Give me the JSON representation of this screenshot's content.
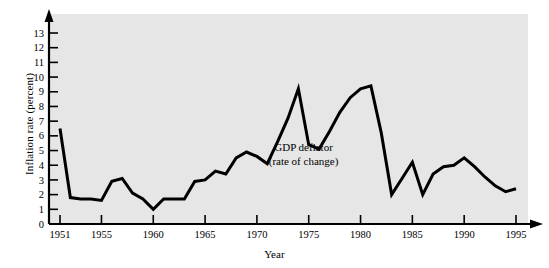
{
  "chart_data": {
    "type": "line",
    "title": "",
    "subtitle": "",
    "xlabel": "Year",
    "ylabel": "Inflation rate (percent)",
    "xlim": [
      1951,
      1995
    ],
    "ylim": [
      0,
      13
    ],
    "grid": false,
    "legend_position": "none",
    "annotations": [
      {
        "name": "series-annotation",
        "line1": "GDP deflator",
        "line2": "(rate of change)",
        "x": 1974.5,
        "y": 5.1
      }
    ],
    "x_ticks_labeled": [
      1951,
      1955,
      1960,
      1965,
      1970,
      1975,
      1980,
      1985,
      1990,
      1995
    ],
    "x_tick_labels": [
      "1951",
      "1955",
      "1960",
      "1965",
      "1970",
      "1975",
      "1980",
      "1985",
      "1990",
      "1995"
    ],
    "y_ticks": [
      0,
      1,
      2,
      3,
      4,
      5,
      6,
      7,
      8,
      9,
      10,
      11,
      12,
      13
    ],
    "y_tick_labels": [
      "0",
      "1",
      "2",
      "3",
      "4",
      "5",
      "6",
      "7",
      "8",
      "9",
      "10",
      "11",
      "12",
      "13"
    ],
    "series": [
      {
        "name": "GDP deflator (rate of change)",
        "color": "#000000",
        "line_width": 3,
        "x": [
          1951,
          1952,
          1953,
          1954,
          1955,
          1956,
          1957,
          1958,
          1959,
          1960,
          1961,
          1962,
          1963,
          1964,
          1965,
          1966,
          1967,
          1968,
          1969,
          1970,
          1971,
          1972,
          1973,
          1974,
          1975,
          1976,
          1977,
          1978,
          1979,
          1980,
          1981,
          1982,
          1983,
          1984,
          1985,
          1986,
          1987,
          1988,
          1989,
          1990,
          1991,
          1992,
          1993,
          1994,
          1995
        ],
        "values": [
          6.5,
          1.8,
          1.7,
          1.7,
          1.6,
          2.9,
          3.1,
          2.1,
          1.7,
          1.0,
          1.7,
          1.7,
          1.7,
          2.9,
          3.0,
          3.6,
          3.4,
          4.5,
          4.9,
          4.6,
          4.1,
          5.6,
          7.2,
          9.2,
          5.4,
          5.1,
          6.3,
          7.6,
          8.6,
          9.2,
          9.4,
          6.2,
          2.0,
          3.1,
          4.2,
          2.0,
          3.4,
          3.9,
          4.0,
          4.5,
          3.9,
          3.2,
          2.6,
          2.2,
          2.4
        ]
      }
    ]
  },
  "axes": {
    "y_axis_name": "inflation-rate-axis",
    "x_axis_name": "year-axis"
  }
}
